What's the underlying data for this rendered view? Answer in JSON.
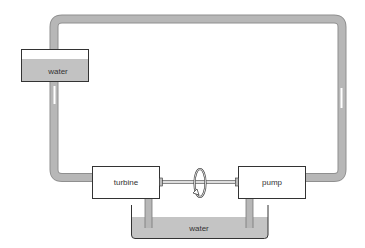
{
  "diagram": {
    "colors": {
      "pipe": "#b3b3b3",
      "pipe_edge": "#8a8a8a",
      "water": "#c4c4c4",
      "box_stroke": "#333333",
      "box_fill": "#ffffff",
      "flow_arrow": "#ffffff"
    },
    "components": {
      "upper_tank": {
        "label": "water"
      },
      "turbine": {
        "label": "turbine"
      },
      "pump": {
        "label": "pump"
      },
      "lower_basin": {
        "label": "water"
      },
      "shaft": {
        "label": ""
      },
      "rotation_symbol": {
        "icon": "rotation-arrow-icon"
      }
    },
    "flow": {
      "left_pipe_direction": "down",
      "right_pipe_direction": "up"
    }
  }
}
